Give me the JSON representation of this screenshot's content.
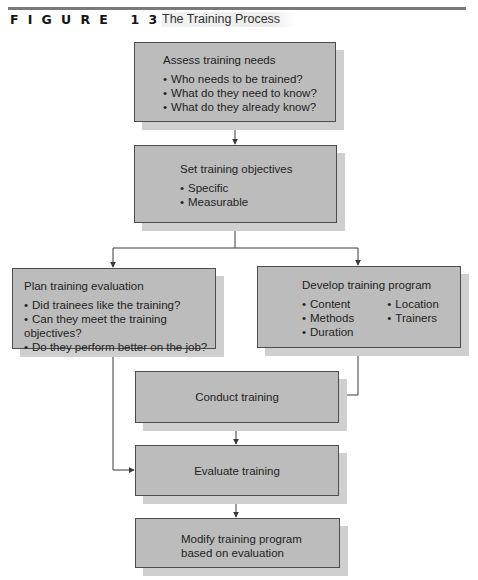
{
  "figure": {
    "label": "FIGURE 13.2",
    "title": "The Training Process"
  },
  "nodes": {
    "assess": {
      "heading": "Assess training needs",
      "bullets": [
        "Who needs to be trained?",
        "What do they need to know?",
        "What do they already know?"
      ]
    },
    "objectives": {
      "heading": "Set training objectives",
      "bullets": [
        "Specific",
        "Measurable"
      ]
    },
    "plan_evaluation": {
      "heading": "Plan training evaluation",
      "bullets": [
        "Did trainees like the training?",
        "Can they meet the training objectives?",
        "Do they perform better on the job?"
      ]
    },
    "develop_program": {
      "heading": "Develop training program",
      "bullets": [
        "Content",
        "Location",
        "Methods",
        "Trainers",
        "Duration"
      ]
    },
    "conduct": {
      "heading": "Conduct training"
    },
    "evaluate": {
      "heading": "Evaluate training"
    },
    "modify": {
      "heading": "Modify training program",
      "heading_line2": "based on evaluation"
    }
  },
  "edges": [
    {
      "from": "assess",
      "to": "objectives"
    },
    {
      "from": "objectives",
      "to": "plan_evaluation"
    },
    {
      "from": "objectives",
      "to": "develop_program"
    },
    {
      "from": "develop_program",
      "to": "conduct"
    },
    {
      "from": "plan_evaluation",
      "to": "evaluate"
    },
    {
      "from": "conduct",
      "to": "evaluate"
    },
    {
      "from": "evaluate",
      "to": "modify"
    }
  ],
  "colors": {
    "box_fill": "#bcbcbc",
    "box_shadow": "#cfcfcf",
    "line": "#3a3a3a"
  }
}
